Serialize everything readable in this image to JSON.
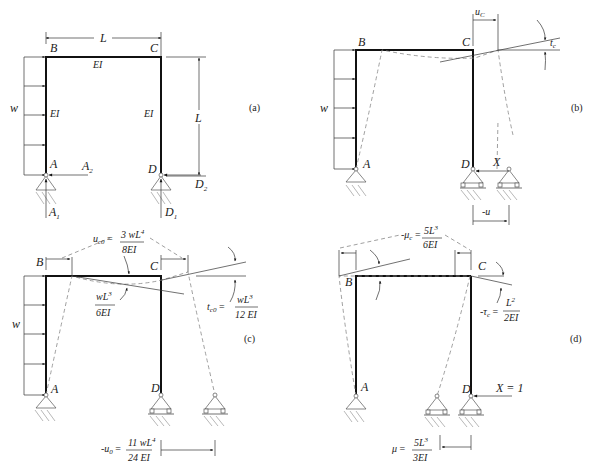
{
  "diagram_type": "structural frame analysis (force method)",
  "panels": {
    "a": {
      "tag": "(a)",
      "nodes": {
        "B": "B",
        "C": "C",
        "A": "A",
        "D": "D"
      },
      "dim_span": "L",
      "dim_height": "L",
      "stiffness_beam": "EI",
      "stiffness_left_col": "EI",
      "stiffness_right_col": "EI",
      "load": "w",
      "reactions": {
        "A1": "A",
        "A1_sub": "1",
        "A2": "A",
        "A2_sub": "2",
        "D1": "D",
        "D1_sub": "1",
        "D2": "D",
        "D2_sub": "2"
      }
    },
    "b": {
      "tag": "(b)",
      "nodes": {
        "B": "B",
        "C": "C",
        "A": "A",
        "D": "D"
      },
      "load": "w",
      "displacement_top": "u",
      "displacement_top_sub": "C",
      "rotation": "t",
      "rotation_sub": "c",
      "redundant": "X",
      "displacement_bottom": "-u"
    },
    "c": {
      "tag": "(c)",
      "nodes": {
        "B": "B",
        "C": "C",
        "A": "A",
        "D": "D"
      },
      "load": "w",
      "u_c0_lhs": "u",
      "u_c0_sub": "c0",
      "u_c0_num": "3 wL",
      "u_c0_num_exp": "4",
      "u_c0_den": "8EI",
      "rot_B_num": "wL",
      "rot_B_num_exp": "3",
      "rot_B_den": "6EI",
      "t_c0_lhs": "t",
      "t_c0_sub": "c0",
      "t_c0_num": "wL",
      "t_c0_num_exp": "3",
      "t_c0_den": "12 EI",
      "u0_lhs": "-u",
      "u0_sub": "0",
      "u0_num": "11 wL",
      "u0_num_exp": "4",
      "u0_den": "24 EI"
    },
    "d": {
      "tag": "(d)",
      "nodes": {
        "B": "B",
        "C": "C",
        "A": "A",
        "D": "D"
      },
      "unit_load": "X = 1",
      "mu_c_lhs": "-μ",
      "mu_c_sub": "c",
      "mu_c_num": "5L",
      "mu_c_num_exp": "3",
      "mu_c_den": "6EI",
      "tau_c_lhs": "-τ",
      "tau_c_sub": "c",
      "tau_c_num": "L",
      "tau_c_num_exp": "2",
      "tau_c_den": "2EI",
      "mu_lhs": "μ",
      "mu_num": "5L",
      "mu_num_exp": "3",
      "mu_den": "3EI"
    }
  },
  "symbols": {
    "equals": "="
  }
}
